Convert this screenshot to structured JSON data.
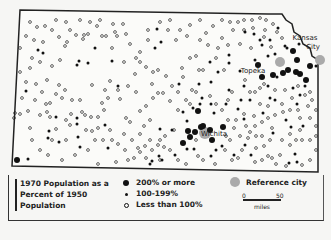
{
  "map": {
    "title": "1970 Population as a Percent of 1950 Population",
    "region": "Kansas",
    "outline": "M20,10 L268,14 L282,14 L286,20 L292,24 L294,32 L300,36 L303,44 L310,48 L312,56 L318,60 L318,172 L12,166 Z",
    "labels": [
      {
        "text": "Kansas",
        "x": 305,
        "y": 40
      },
      {
        "text": "City",
        "x": 313,
        "y": 49
      },
      {
        "text": "Topeka",
        "x": 253,
        "y": 73
      },
      {
        "text": "Wichita",
        "x": 214,
        "y": 136
      }
    ],
    "reference_cities": [
      {
        "name": "Kansas City",
        "x": 320,
        "y": 60,
        "r": 5
      },
      {
        "name": "Topeka",
        "x": 280,
        "y": 62,
        "r": 5
      },
      {
        "name": "Wichita",
        "x": 205,
        "y": 133,
        "r": 6
      }
    ],
    "large_dots": [
      [
        293,
        51
      ],
      [
        283,
        73
      ],
      [
        297,
        60
      ],
      [
        306,
        80
      ],
      [
        310,
        66
      ],
      [
        296,
        72
      ],
      [
        300,
        74
      ],
      [
        273,
        75
      ],
      [
        288,
        70
      ],
      [
        198,
        111
      ],
      [
        201,
        127
      ],
      [
        195,
        132
      ],
      [
        188,
        131
      ],
      [
        203,
        126
      ],
      [
        210,
        130
      ],
      [
        212,
        140
      ],
      [
        183,
        143
      ],
      [
        190,
        137
      ],
      [
        223,
        127
      ],
      [
        17,
        160
      ],
      [
        258,
        65
      ],
      [
        262,
        77
      ]
    ],
    "small_dots": [
      [
        95,
        48
      ],
      [
        112,
        61
      ],
      [
        79,
        61
      ],
      [
        88,
        63
      ],
      [
        77,
        65
      ],
      [
        26,
        91
      ],
      [
        118,
        86
      ],
      [
        56,
        117
      ],
      [
        77,
        124
      ],
      [
        105,
        125
      ],
      [
        48,
        138
      ],
      [
        59,
        142
      ],
      [
        78,
        137
      ],
      [
        80,
        147
      ],
      [
        108,
        148
      ],
      [
        28,
        159
      ],
      [
        38,
        50
      ],
      [
        43,
        53
      ],
      [
        49,
        131
      ],
      [
        77,
        118
      ],
      [
        157,
        29
      ],
      [
        155,
        48
      ],
      [
        161,
        42
      ],
      [
        179,
        84
      ],
      [
        211,
        82
      ],
      [
        229,
        90
      ],
      [
        202,
        98
      ],
      [
        260,
        40
      ],
      [
        270,
        40
      ],
      [
        262,
        45
      ],
      [
        254,
        34
      ],
      [
        245,
        32
      ],
      [
        278,
        28
      ],
      [
        275,
        54
      ],
      [
        287,
        48
      ],
      [
        299,
        44
      ],
      [
        316,
        66
      ],
      [
        305,
        86
      ],
      [
        293,
        88
      ],
      [
        277,
        77
      ],
      [
        268,
        86
      ],
      [
        244,
        86
      ],
      [
        241,
        100
      ],
      [
        226,
        104
      ],
      [
        211,
        104
      ],
      [
        200,
        104
      ],
      [
        193,
        108
      ],
      [
        214,
        113
      ],
      [
        183,
        112
      ],
      [
        187,
        121
      ],
      [
        160,
        129
      ],
      [
        172,
        130
      ],
      [
        159,
        156
      ],
      [
        194,
        149
      ],
      [
        211,
        156
      ],
      [
        222,
        146
      ],
      [
        216,
        150
      ],
      [
        150,
        164
      ],
      [
        162,
        160
      ],
      [
        295,
        154
      ],
      [
        289,
        163
      ],
      [
        297,
        162
      ],
      [
        275,
        100
      ],
      [
        300,
        95
      ],
      [
        297,
        104
      ],
      [
        263,
        113
      ],
      [
        187,
        149
      ],
      [
        152,
        161
      ],
      [
        244,
        119
      ],
      [
        238,
        109
      ],
      [
        303,
        126
      ],
      [
        291,
        127
      ],
      [
        273,
        133
      ],
      [
        245,
        145
      ],
      [
        251,
        155
      ],
      [
        286,
        120
      ],
      [
        175,
        155
      ],
      [
        234,
        155
      ],
      [
        270,
        98
      ],
      [
        268,
        56
      ],
      [
        285,
        46
      ],
      [
        255,
        60
      ],
      [
        229,
        55
      ],
      [
        240,
        71
      ],
      [
        199,
        84
      ],
      [
        210,
        62
      ],
      [
        218,
        72
      ],
      [
        229,
        63
      ],
      [
        250,
        100
      ]
    ],
    "open_dots": [
      [
        37,
        27
      ],
      [
        45,
        26
      ],
      [
        66,
        22
      ],
      [
        90,
        22
      ],
      [
        113,
        24
      ],
      [
        123,
        24
      ],
      [
        97,
        26
      ],
      [
        115,
        32
      ],
      [
        117,
        36
      ],
      [
        106,
        36
      ],
      [
        112,
        48
      ],
      [
        130,
        44
      ],
      [
        140,
        52
      ],
      [
        140,
        62
      ],
      [
        153,
        72
      ],
      [
        158,
        70
      ],
      [
        146,
        67
      ],
      [
        135,
        74
      ],
      [
        152,
        84
      ],
      [
        166,
        76
      ],
      [
        172,
        86
      ],
      [
        183,
        77
      ],
      [
        182,
        68
      ],
      [
        190,
        58
      ],
      [
        176,
        40
      ],
      [
        168,
        30
      ],
      [
        180,
        30
      ],
      [
        190,
        25
      ],
      [
        187,
        36
      ],
      [
        200,
        40
      ],
      [
        206,
        33
      ],
      [
        208,
        45
      ],
      [
        218,
        48
      ],
      [
        222,
        38
      ],
      [
        213,
        26
      ],
      [
        230,
        22
      ],
      [
        238,
        22
      ],
      [
        244,
        20
      ],
      [
        233,
        30
      ],
      [
        244,
        30
      ],
      [
        252,
        20
      ],
      [
        260,
        18
      ],
      [
        266,
        20
      ],
      [
        273,
        24
      ],
      [
        265,
        30
      ],
      [
        277,
        32
      ],
      [
        282,
        38
      ],
      [
        271,
        47
      ],
      [
        264,
        37
      ],
      [
        253,
        28
      ],
      [
        251,
        48
      ],
      [
        240,
        44
      ],
      [
        228,
        45
      ],
      [
        203,
        70
      ],
      [
        199,
        70
      ],
      [
        196,
        56
      ],
      [
        216,
        58
      ],
      [
        224,
        70
      ],
      [
        210,
        96
      ],
      [
        192,
        90
      ],
      [
        170,
        101
      ],
      [
        163,
        93
      ],
      [
        158,
        93
      ],
      [
        153,
        98
      ],
      [
        146,
        106
      ],
      [
        140,
        111
      ],
      [
        136,
        92
      ],
      [
        120,
        99
      ],
      [
        108,
        98
      ],
      [
        102,
        103
      ],
      [
        98,
        117
      ],
      [
        91,
        117
      ],
      [
        85,
        115
      ],
      [
        82,
        112
      ],
      [
        71,
        114
      ],
      [
        65,
        90
      ],
      [
        59,
        85
      ],
      [
        47,
        80
      ],
      [
        30,
        68
      ],
      [
        20,
        48
      ],
      [
        43,
        42
      ],
      [
        67,
        42
      ],
      [
        65,
        46
      ],
      [
        76,
        35
      ],
      [
        84,
        35
      ],
      [
        59,
        37
      ],
      [
        83,
        39
      ],
      [
        88,
        34
      ],
      [
        102,
        36
      ],
      [
        126,
        34
      ],
      [
        92,
        85
      ],
      [
        110,
        81
      ],
      [
        105,
        90
      ],
      [
        118,
        90
      ],
      [
        128,
        86
      ],
      [
        126,
        118
      ],
      [
        130,
        122
      ],
      [
        110,
        130
      ],
      [
        98,
        128
      ],
      [
        92,
        131
      ],
      [
        86,
        130
      ],
      [
        70,
        125
      ],
      [
        66,
        120
      ],
      [
        56,
        129
      ],
      [
        50,
        117
      ],
      [
        47,
        112
      ],
      [
        40,
        115
      ],
      [
        28,
        111
      ],
      [
        20,
        114
      ],
      [
        15,
        113
      ],
      [
        52,
        140
      ],
      [
        22,
        98
      ],
      [
        35,
        100
      ],
      [
        46,
        104
      ],
      [
        50,
        103
      ],
      [
        20,
        72
      ],
      [
        14,
        118
      ],
      [
        98,
        164
      ],
      [
        116,
        162
      ],
      [
        128,
        160
      ],
      [
        134,
        158
      ],
      [
        140,
        152
      ],
      [
        138,
        148
      ],
      [
        145,
        146
      ],
      [
        150,
        140
      ],
      [
        160,
        140
      ],
      [
        165,
        136
      ],
      [
        174,
        130
      ],
      [
        178,
        110
      ],
      [
        190,
        104
      ],
      [
        216,
        104
      ],
      [
        228,
        100
      ],
      [
        232,
        92
      ],
      [
        245,
        80
      ],
      [
        250,
        92
      ],
      [
        255,
        92
      ],
      [
        260,
        88
      ],
      [
        264,
        84
      ],
      [
        275,
        90
      ],
      [
        285,
        90
      ],
      [
        298,
        86
      ],
      [
        305,
        95
      ],
      [
        310,
        92
      ],
      [
        312,
        100
      ],
      [
        316,
        110
      ],
      [
        310,
        118
      ],
      [
        300,
        118
      ],
      [
        298,
        110
      ],
      [
        290,
        110
      ],
      [
        283,
        112
      ],
      [
        275,
        115
      ],
      [
        268,
        118
      ],
      [
        262,
        122
      ],
      [
        255,
        126
      ],
      [
        250,
        132
      ],
      [
        240,
        136
      ],
      [
        234,
        128
      ],
      [
        228,
        120
      ],
      [
        222,
        110
      ],
      [
        225,
        150
      ],
      [
        238,
        158
      ],
      [
        255,
        162
      ],
      [
        262,
        160
      ],
      [
        268,
        156
      ],
      [
        272,
        158
      ],
      [
        280,
        155
      ],
      [
        276,
        164
      ],
      [
        286,
        166
      ],
      [
        302,
        165
      ],
      [
        310,
        160
      ],
      [
        316,
        150
      ],
      [
        310,
        140
      ],
      [
        302,
        140
      ],
      [
        296,
        140
      ],
      [
        290,
        145
      ],
      [
        282,
        140
      ],
      [
        270,
        140
      ],
      [
        264,
        146
      ],
      [
        256,
        148
      ],
      [
        248,
        138
      ],
      [
        242,
        150
      ],
      [
        232,
        160
      ],
      [
        215,
        164
      ],
      [
        203,
        160
      ],
      [
        198,
        156
      ],
      [
        186,
        164
      ],
      [
        178,
        160
      ],
      [
        170,
        150
      ],
      [
        164,
        147
      ],
      [
        158,
        145
      ],
      [
        152,
        150
      ],
      [
        146,
        158
      ],
      [
        125,
        150
      ],
      [
        118,
        144
      ],
      [
        112,
        140
      ],
      [
        103,
        140
      ],
      [
        95,
        140
      ],
      [
        88,
        150
      ],
      [
        75,
        155
      ],
      [
        62,
        160
      ],
      [
        48,
        155
      ],
      [
        40,
        150
      ],
      [
        32,
        140
      ],
      [
        30,
        128
      ],
      [
        66,
        140
      ],
      [
        160,
        160
      ],
      [
        196,
        140
      ],
      [
        226,
        136
      ],
      [
        230,
        140
      ],
      [
        236,
        120
      ],
      [
        244,
        114
      ],
      [
        254,
        116
      ],
      [
        260,
        104
      ],
      [
        268,
        106
      ],
      [
        282,
        104
      ],
      [
        292,
        98
      ],
      [
        308,
        106
      ],
      [
        316,
        126
      ],
      [
        316,
        136
      ],
      [
        300,
        130
      ],
      [
        290,
        134
      ],
      [
        272,
        128
      ],
      [
        262,
        136
      ],
      [
        256,
        136
      ],
      [
        246,
        126
      ],
      [
        186,
        100
      ],
      [
        196,
        92
      ],
      [
        178,
        92
      ],
      [
        150,
        120
      ],
      [
        144,
        126
      ],
      [
        140,
        134
      ],
      [
        132,
        140
      ],
      [
        124,
        134
      ],
      [
        104,
        110
      ],
      [
        80,
        100
      ],
      [
        72,
        100
      ],
      [
        62,
        98
      ],
      [
        56,
        94
      ],
      [
        42,
        92
      ],
      [
        36,
        84
      ],
      [
        26,
        82
      ],
      [
        60,
        60
      ],
      [
        52,
        66
      ],
      [
        40,
        62
      ],
      [
        32,
        58
      ],
      [
        124,
        62
      ],
      [
        136,
        58
      ],
      [
        148,
        40
      ],
      [
        148,
        30
      ],
      [
        160,
        22
      ],
      [
        170,
        20
      ],
      [
        200,
        20
      ],
      [
        222,
        20
      ],
      [
        100,
        20
      ],
      [
        80,
        20
      ],
      [
        56,
        20
      ],
      [
        30,
        22
      ],
      [
        26,
        36
      ],
      [
        34,
        40
      ],
      [
        52,
        30
      ],
      [
        70,
        30
      ]
    ]
  },
  "legend": {
    "title_line1": "1970 Population as a",
    "title_line2": "Percent of 1950",
    "title_line3": "Population",
    "items": [
      {
        "symbol": "large-dot",
        "label": "200% or more"
      },
      {
        "symbol": "small-dot",
        "label": "100-199%"
      },
      {
        "symbol": "open-dot",
        "label": "Less than 100%"
      }
    ],
    "reference_city_label": "Reference city",
    "scale": {
      "start": "0",
      "end": "50",
      "unit": "miles"
    }
  },
  "colors": {
    "ink": "#111111",
    "reference_city": "#aaaaaa",
    "background": "#f6f6f4"
  }
}
